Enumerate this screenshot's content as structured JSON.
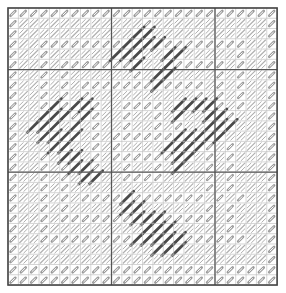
{
  "grid": {
    "cols": 26,
    "rows": 27,
    "origin_x": 8,
    "origin_y": 8,
    "cell_w": 10.35,
    "cell_h": 10.26,
    "major_every": 10,
    "major_offset_x": 10,
    "major_offset_y": 6,
    "major_lines_x": [
      10,
      20
    ],
    "major_lines_y": [
      6,
      16
    ]
  },
  "colors": {
    "background": "#ffffff",
    "grid_minor": "#b8b8b8",
    "grid_major": "#555555",
    "border": "#444444",
    "arrow_stitch": "#9a9a9a",
    "hatch": "#b0b0b0",
    "dark_stitch": "#4a4a4a"
  },
  "legend": {
    "a": "arrow-stitch",
    "h": "light-diagonal-hatch",
    "d": "dark-diagonal-stitch",
    ".": "empty"
  },
  "cells": [
    "aaaaaaaaaaaaaaaaaaaaaaaaaa",
    "ahhhhhhhhhhhhahhhhhhhhhhha",
    "ahhhhhhhhhhhddhhhhhhhhhhha",
    "ahhaaaaaaaaddddaaaaaaaahha",
    "ahhahhhhhhdddhhddhhhhhahha",
    "ahhahaaaaaaadhhdaaaaahahha",
    "ahhahahhhhhhahddhhhhahahha",
    "ahhahahaaaaaaadaaaahahahha",
    "ahhahahahhhhhhhhhhahahahha",
    "ahhadaddahhaaaahddddahahha",
    "ahhdddadahhahhahdhhddahhha",
    "ahdddhdhahhahhahahhdddhhha",
    "ahhddddhahaaaaaadddddhhhha",
    "ahhhddhhahahhhhddddahahhha",
    "ahhahddhahaaaaaaddhahahhha",
    "ahhahaddahhahhahdhhahahhha",
    "ahhahahddhhaaaahhhhahahhha",
    "ahhahahhhhhhhhhhhhhahahhha",
    "ahhahahaaaadaaaaaaahahahha",
    "ahhahahhhhhddhhhhhhahahhha",
    "ahhahaaaaaaadddaaaaahahhha",
    "ahhahhhhhhhhhdddhhhhhahhha",
    "ahhaaaaaaaaadddddaaaaaahha",
    "ahhhhhhhhhhhhhdddhhhhhhhha",
    "ahhhhhhhhhhhhhhhhhhhhhhhha",
    "aaaaaaaaaaaaaaaaaaaaaaaaaa",
    "aaaaaaaaaaaaaaaaaaaaaaaaaa"
  ]
}
